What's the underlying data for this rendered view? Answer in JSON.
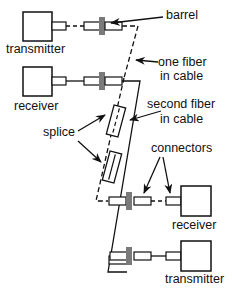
{
  "labels": {
    "transmitter_top": "transmitter",
    "receiver_top": "receiver",
    "barrel": "barrel",
    "one_fiber_1": "one fiber",
    "one_fiber_2": "in cable",
    "second_fiber_1": "second fiber",
    "second_fiber_2": "in cable",
    "splice": "splice",
    "connectors": "connectors",
    "receiver_bottom": "receiver",
    "transmitter_bottom": "transmitter"
  },
  "colors": {
    "line": "#111111",
    "barrel": "#7a7a7a"
  }
}
